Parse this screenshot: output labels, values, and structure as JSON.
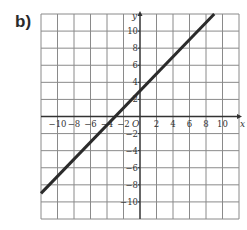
{
  "part_label": "b)",
  "chart_data": {
    "type": "line",
    "title": "",
    "xlabel": "x",
    "ylabel": "y",
    "origin_label": "O",
    "xlim": [
      -12,
      12
    ],
    "ylim": [
      -12,
      12
    ],
    "grid": true,
    "grid_step": 2,
    "x_ticks": [
      -10,
      -8,
      -6,
      -4,
      -2,
      2,
      4,
      6,
      8,
      10
    ],
    "y_ticks": [
      10,
      8,
      6,
      4,
      2,
      -2,
      -4,
      -6,
      -8,
      -10
    ],
    "x_tick_labels": [
      "−10",
      "−8",
      "−6",
      "−4",
      "−2",
      "2",
      "4",
      "6",
      "8",
      "10"
    ],
    "y_tick_labels": [
      "10",
      "8",
      "6",
      "4",
      "2",
      "−2",
      "−4",
      "−6",
      "−8",
      "−10"
    ],
    "series": [
      {
        "name": "y = x + 3",
        "slope": 1,
        "intercept": 3,
        "x": [
          -12,
          9
        ],
        "y": [
          -9,
          12
        ]
      }
    ],
    "legend": null
  },
  "colors": {
    "grid": "#8a8a8a",
    "axis": "#333333",
    "line": "#2b2b2b"
  }
}
